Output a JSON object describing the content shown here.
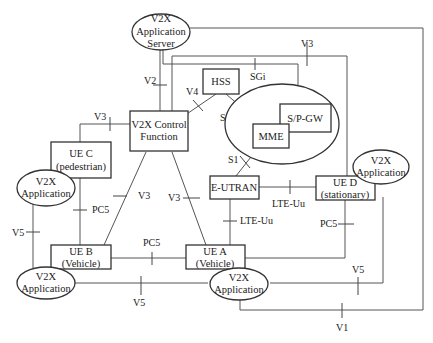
{
  "diagram": {
    "colors": {
      "line": "#555555",
      "stroke": "#333333",
      "text": "#222222",
      "background": "#ffffff"
    },
    "nodes": {
      "app_server": {
        "lines": [
          "V2X",
          "Application",
          "Server"
        ]
      },
      "hss": {
        "label": "HSS"
      },
      "spgw": {
        "label": "S/P-GW"
      },
      "mme": {
        "label": "MME"
      },
      "v2x_cf": {
        "lines": [
          "V2X Control",
          "Function"
        ]
      },
      "ue_c": {
        "lines": [
          "UE C",
          "(pedestrian)"
        ]
      },
      "app_c": {
        "lines": [
          "V2X",
          "Application"
        ]
      },
      "eutran": {
        "label": "E-UTRAN"
      },
      "ue_d": {
        "lines": [
          "UE D",
          "(stationary)"
        ]
      },
      "app_d": {
        "lines": [
          "V2X",
          "Application"
        ]
      },
      "ue_b": {
        "lines": [
          "UE B",
          "(Vehicle)"
        ]
      },
      "app_b": {
        "lines": [
          "V2X",
          "Application"
        ]
      },
      "ue_a": {
        "lines": [
          "UE A",
          "(Vehicle)"
        ]
      },
      "app_a": {
        "lines": [
          "V2X",
          "Application"
        ]
      }
    },
    "interfaces": {
      "v3_top": "V3",
      "sgi": "SGi",
      "v2": "V2",
      "v4": "V4",
      "s6a": "S6a",
      "v3_uec": "V3",
      "s1": "S1",
      "v3_ueb": "V3",
      "v3_uea": "V3",
      "lte_uu_d": "LTE-Uu",
      "lte_uu_a": "LTE-Uu",
      "pc5_cb": "PC5",
      "pc5_ba": "PC5",
      "pc5_ad": "PC5",
      "v5_left": "V5",
      "v5_bottom": "V5",
      "v5_right": "V5",
      "v1": "V1"
    }
  }
}
